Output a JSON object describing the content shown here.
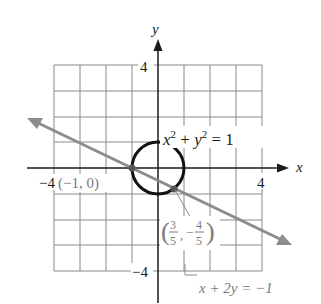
{
  "figure": {
    "axes": {
      "x_label": "x",
      "y_label": "y",
      "x_tick_pos": "4",
      "x_tick_neg": "−4",
      "y_tick_pos": "4",
      "y_tick_neg": "−4"
    },
    "circle": {
      "equation_lhs_x": "x",
      "equation_exp": "2",
      "equation_plus": " + ",
      "equation_lhs_y": "y",
      "equation_rhs": " = 1"
    },
    "line": {
      "equation": "x + 2y = −1"
    },
    "points": {
      "p1_label": "(−1, 0)",
      "p2_num_x": "3",
      "p2_den_x": "5",
      "p2_num_y": "4",
      "p2_den_y": "5",
      "p2_neg": "−",
      "p2_comma": ","
    },
    "colors": {
      "grid": "#8a8a8a",
      "axes": "#1a1a1a",
      "circle": "#111111",
      "line": "#8c8c8c",
      "label_gray": "#7a7a7a"
    }
  }
}
